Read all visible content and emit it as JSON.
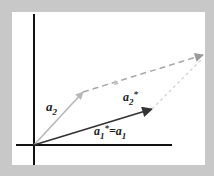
{
  "diagram": {
    "title": "",
    "colors": {
      "frame": "#c8c8c8",
      "panel": "#ffffff",
      "axes": "#111111",
      "a1": "#333333",
      "a2": "#b8b8b8",
      "dashed": "#a8a8a8",
      "dotted": "#d4d4d4"
    },
    "labels": {
      "a2": {
        "base": "a",
        "sub": "2"
      },
      "a2_star": {
        "base": "a",
        "sub": "2",
        "sup": "*"
      },
      "a1_eq": {
        "base": "a",
        "sub": "1",
        "sup": "*",
        "eq": "=",
        "base2": "a",
        "sub2": "1"
      }
    },
    "vectors": [
      {
        "name": "a1",
        "from": [
          34,
          145
        ],
        "to": [
          152,
          109
        ],
        "style": "solid-dark"
      },
      {
        "name": "a2",
        "from": [
          34,
          145
        ],
        "to": [
          83,
          92
        ],
        "style": "solid-light"
      },
      {
        "name": "a2-translated",
        "from": [
          83,
          92
        ],
        "to": [
          203,
          55
        ],
        "style": "dashed"
      },
      {
        "name": "a2-star",
        "from": [
          152,
          109
        ],
        "to": [
          203,
          58
        ],
        "style": "dotted"
      }
    ],
    "axes": {
      "x": {
        "from": [
          16,
          145
        ],
        "to": [
          172,
          145
        ]
      },
      "y": {
        "from": [
          34,
          14
        ],
        "to": [
          34,
          165
        ]
      }
    }
  }
}
